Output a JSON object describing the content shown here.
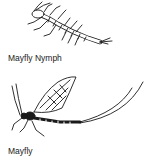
{
  "figures": [
    {
      "id": "nymph",
      "caption": "Mayfly Nymph",
      "icon": "mayfly-nymph-illustration"
    },
    {
      "id": "adult",
      "caption": "Mayfly",
      "icon": "mayfly-adult-illustration"
    }
  ],
  "colors": {
    "ink": "#1a1a1a",
    "background": "#ffffff"
  }
}
